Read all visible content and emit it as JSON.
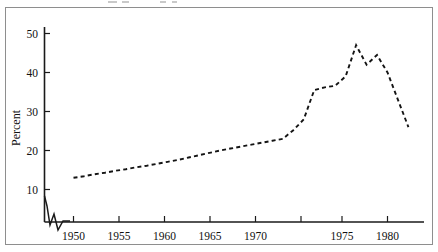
{
  "chart_data": {
    "type": "line",
    "title": "",
    "subtitle": "",
    "xlabel": "",
    "ylabel": "Percent",
    "xlim": [
      1948,
      1983
    ],
    "ylim": [
      0,
      55
    ],
    "grid": false,
    "legend": null,
    "line_style": "dashed",
    "x_ticks": [
      1950,
      1955,
      1960,
      1965,
      1970,
      1975,
      1980
    ],
    "x_tick_labels": [
      "1950",
      "1955",
      "1960",
      "1965",
      "1970",
      "1975",
      "1980"
    ],
    "y_ticks": [
      10,
      20,
      30,
      40,
      50
    ],
    "y_tick_labels": [
      "10",
      "20",
      "30",
      "40",
      "50"
    ],
    "series": [
      {
        "name": "Percent",
        "x": [
          1950,
          1951,
          1952,
          1953,
          1954,
          1955,
          1956,
          1957,
          1958,
          1959,
          1960,
          1961,
          1962,
          1963,
          1964,
          1965,
          1966,
          1967,
          1968,
          1969,
          1970,
          1971,
          1972,
          1973,
          1974,
          1975,
          1976,
          1977,
          1978,
          1979,
          1980,
          1981,
          1982
        ],
        "values": [
          13.0,
          13.4,
          13.9,
          14.3,
          14.8,
          15.2,
          15.7,
          16.1,
          16.6,
          17.1,
          17.6,
          18.2,
          18.8,
          19.4,
          20.0,
          20.5,
          21.0,
          21.5,
          22.0,
          22.5,
          23.0,
          25.2,
          28.0,
          35.5,
          36.2,
          36.6,
          39.0,
          47.0,
          42.0,
          44.5,
          40.0,
          33.0,
          26.0
        ]
      }
    ],
    "annotations": []
  },
  "axes": {
    "y_axis_title": "Percent"
  },
  "artifacts": {
    "scan_zigzag_present": true,
    "top_edge_text_cropped": true
  }
}
